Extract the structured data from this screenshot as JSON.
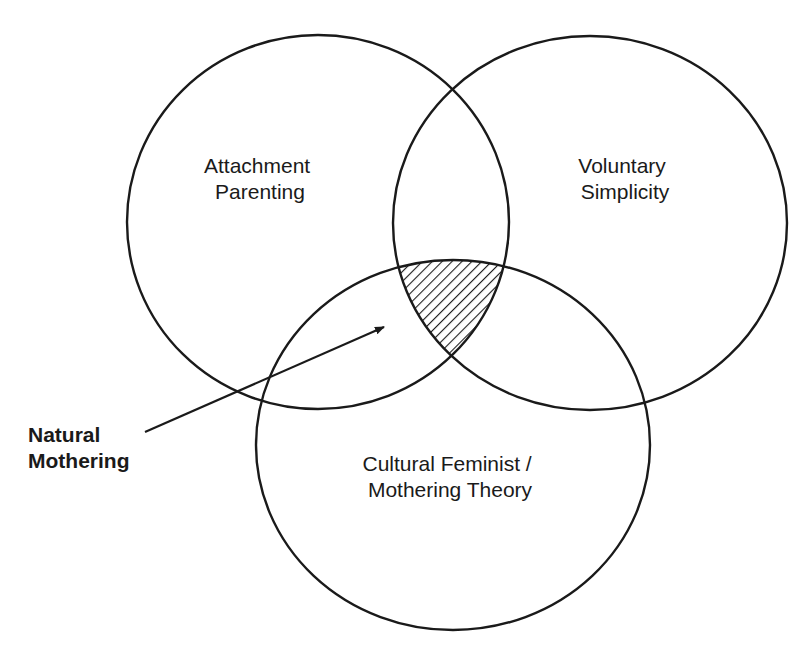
{
  "diagram": {
    "type": "venn",
    "colors": {
      "stroke": "#1a1a1a",
      "background": "#ffffff",
      "hatch": "#1a1a1a"
    },
    "sets": [
      {
        "id": "attachment",
        "label_lines": [
          "Attachment",
          "Parenting"
        ]
      },
      {
        "id": "simplicity",
        "label_lines": [
          "Voluntary",
          "Simplicity"
        ]
      },
      {
        "id": "feminist",
        "label_lines": [
          "Cultural Feminist /",
          "Mothering Theory"
        ]
      }
    ],
    "intersection": {
      "sets": [
        "attachment",
        "simplicity",
        "feminist"
      ],
      "fill": "diagonal-hatch",
      "callout_lines": [
        "Natural",
        "Mothering"
      ]
    }
  }
}
